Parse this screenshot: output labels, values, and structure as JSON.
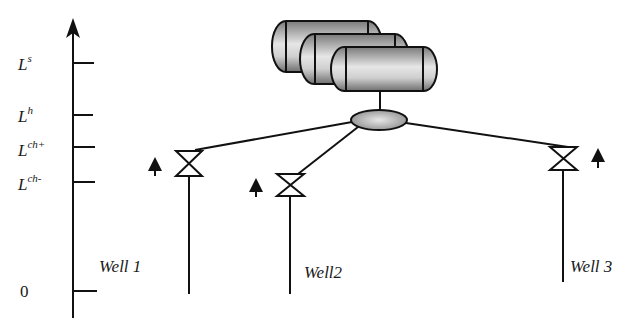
{
  "diagram": {
    "type": "well-manifold-separator level diagram",
    "axis": {
      "levels": [
        {
          "base": "L",
          "sup": "s",
          "y": 63
        },
        {
          "base": "L",
          "sup": "h",
          "y": 115
        },
        {
          "base": "L",
          "sup": "ch+",
          "y": 147
        },
        {
          "base": "L",
          "sup": "ch-",
          "y": 182
        },
        {
          "base": "0",
          "sup": "",
          "y": 291
        }
      ]
    },
    "wells": [
      {
        "label": "Well 1",
        "valve_x": 189,
        "valve_y": 163,
        "arrow_side": "left"
      },
      {
        "label": "Well2",
        "valve_x": 290,
        "valve_y": 185,
        "arrow_side": "left"
      },
      {
        "label": "Well 3",
        "valve_x": 563,
        "valve_y": 158,
        "arrow_side": "right"
      }
    ],
    "tanks": [
      {
        "name": "separator-tank-1"
      },
      {
        "name": "separator-tank-2"
      },
      {
        "name": "separator-tank-3"
      }
    ],
    "manifold": {
      "name": "manifold"
    },
    "colors": {
      "line": "#111111",
      "fill_gray": "#9a9a9a",
      "background": "#ffffff"
    }
  }
}
